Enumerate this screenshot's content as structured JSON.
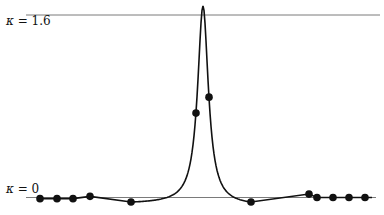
{
  "chart_data": {
    "type": "line",
    "title": "",
    "xlabel": "",
    "ylabel": "κ",
    "ylim": [
      0,
      1.6
    ],
    "grid": false,
    "legend": null,
    "reference_lines": [
      {
        "label": "κ = 1.6",
        "value": 1.6
      },
      {
        "label": "κ = 0",
        "value": 0
      }
    ],
    "annotations": [
      "κ = 1.6",
      "κ = 0"
    ],
    "curve_peak": {
      "x_px": 203,
      "value": 1.68
    },
    "series": [
      {
        "name": "sampled points",
        "marker": "filled-circle",
        "x_px": [
          40,
          57,
          73,
          90,
          131,
          196,
          209,
          251,
          309,
          317,
          333,
          349,
          365
        ],
        "values": [
          -0.01,
          -0.01,
          -0.01,
          0.01,
          -0.04,
          0.74,
          0.88,
          -0.04,
          0.03,
          0.0,
          0.0,
          0.0,
          0.0
        ]
      }
    ]
  },
  "labels": {
    "top": {
      "kappa": "κ",
      "rest": " = 1.6"
    },
    "bottom": {
      "kappa": "κ",
      "rest": " = 0"
    }
  },
  "colors": {
    "curve": "#111111",
    "reference_line": "#7a7a7a",
    "marker": "#111111"
  }
}
